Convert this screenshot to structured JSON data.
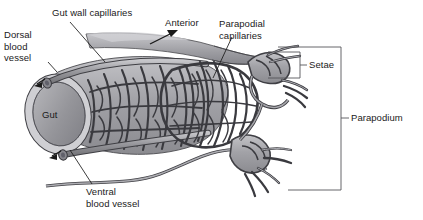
{
  "figure": {
    "background_color": "#ffffff",
    "ink_color": "#1a1a1a",
    "tissue_fill": "#a8a8ac",
    "gut_fill": "#8f9094",
    "vessel_fill": "#9a9a9e"
  },
  "labels": {
    "gut_wall_capillaries": "Gut wall capillaries",
    "dorsal_blood_vessel": "Dorsal\nblood\nvessel",
    "anterior": "Anterior",
    "parapodial_capillaries": "Parapodial\ncapillaries",
    "setae": "Setae",
    "parapodium": "Parapodium",
    "gut": "Gut",
    "ventral_blood_vessel": "Ventral\nblood vessel"
  },
  "brackets": [
    {
      "name": "setae",
      "label": "Setae",
      "x_left": 268,
      "x_right": 300,
      "y_top": 52,
      "y_bottom": 78
    },
    {
      "name": "parapodium",
      "label": "Parapodium",
      "x_left": 278,
      "x_right": 341,
      "y_top": 47,
      "y_bottom": 190
    }
  ],
  "leader_lines": [
    {
      "name": "gut-wall-capillaries-leader",
      "from": [
        70,
        22
      ],
      "to": [
        105,
        62
      ]
    },
    {
      "name": "dorsal-blood-vessel-leader",
      "from": [
        48,
        60
      ],
      "to": [
        57,
        70
      ]
    },
    {
      "name": "parapodial-capillaries-leader",
      "from": [
        232,
        36
      ],
      "to": [
        213,
        78
      ]
    },
    {
      "name": "ventral-blood-vessel-leader",
      "from": [
        92,
        186
      ],
      "to": [
        70,
        150
      ]
    }
  ],
  "arrows": [
    {
      "name": "anterior-arrow",
      "from": [
        152,
        43
      ],
      "to": [
        176,
        31
      ]
    },
    {
      "name": "dorsal-vessel-flow-arrow",
      "from": [
        44,
        80
      ],
      "to": [
        36,
        84
      ]
    },
    {
      "name": "ventral-vessel-flow-arrow",
      "from": [
        60,
        152
      ],
      "to": [
        50,
        157
      ]
    }
  ]
}
